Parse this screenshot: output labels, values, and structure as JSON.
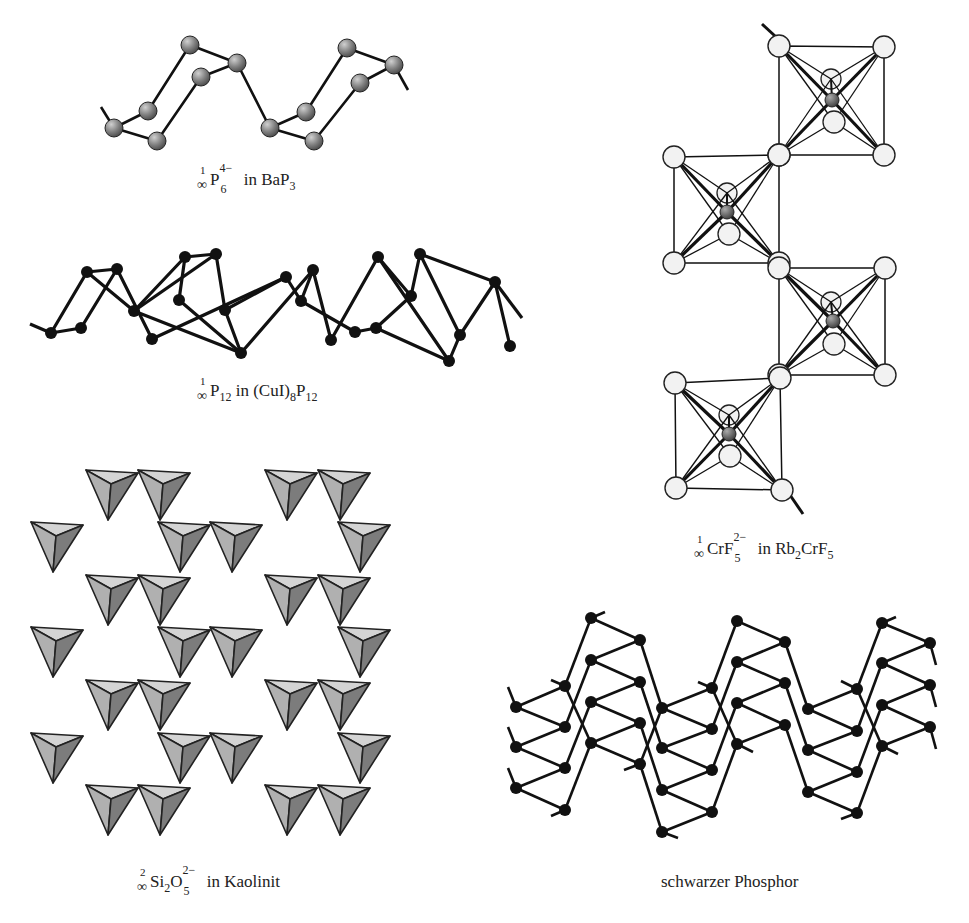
{
  "figure": {
    "panels": [
      {
        "id": "bap3",
        "caption": {
          "dim": "1",
          "inf": "∞",
          "species": "P",
          "sub": "6",
          "sup": "4−",
          "text": " in BaP",
          "tail_sub": "3"
        },
        "caption_pos": [
          197,
          171
        ],
        "atom_style": {
          "fill": "#8a8a8a",
          "r": 9
        },
        "atoms": [
          [
            114,
            128
          ],
          [
            148,
            111
          ],
          [
            157,
            141
          ],
          [
            190,
            45
          ],
          [
            201,
            77
          ],
          [
            237,
            63
          ],
          [
            270,
            128
          ],
          [
            306,
            112
          ],
          [
            314,
            141
          ],
          [
            347,
            48
          ],
          [
            360,
            83
          ],
          [
            394,
            65
          ]
        ],
        "bonds": [
          [
            0,
            1
          ],
          [
            0,
            2
          ],
          [
            1,
            3
          ],
          [
            2,
            4
          ],
          [
            3,
            5
          ],
          [
            4,
            5
          ],
          [
            5,
            6
          ],
          [
            6,
            7
          ],
          [
            6,
            8
          ],
          [
            7,
            9
          ],
          [
            8,
            10
          ],
          [
            9,
            11
          ],
          [
            10,
            11
          ]
        ],
        "tails": [
          [
            [
              114,
              128
            ],
            [
              101,
              107
            ]
          ],
          [
            [
              394,
              65
            ],
            [
              408,
              90
            ]
          ]
        ]
      },
      {
        "id": "cui8p12",
        "caption": {
          "dim": "1",
          "inf": "∞",
          "species": "P",
          "sub": "12",
          "text": " in (CuI)",
          "tail_sub": "8",
          "text2": "P",
          "tail_sub2": "12"
        },
        "caption_pos": [
          197,
          382
        ],
        "atom_style": {
          "fill": "#111111",
          "r": 6
        },
        "atoms": [
          [
            51,
            333
          ],
          [
            81,
            328
          ],
          [
            87,
            272
          ],
          [
            117,
            269
          ],
          [
            134,
            311
          ],
          [
            152,
            339
          ],
          [
            179,
            300
          ],
          [
            185,
            257
          ],
          [
            216,
            254
          ],
          [
            225,
            310
          ],
          [
            241,
            353
          ],
          [
            286,
            277
          ],
          [
            301,
            301
          ],
          [
            313,
            270
          ],
          [
            331,
            340
          ],
          [
            355,
            332
          ],
          [
            376,
            328
          ],
          [
            378,
            257
          ],
          [
            411,
            296
          ],
          [
            420,
            254
          ],
          [
            449,
            361
          ],
          [
            460,
            335
          ],
          [
            495,
            282
          ],
          [
            510,
            346
          ]
        ],
        "bonds": [
          [
            0,
            1
          ],
          [
            0,
            2
          ],
          [
            1,
            3
          ],
          [
            2,
            3
          ],
          [
            2,
            4
          ],
          [
            3,
            5
          ],
          [
            4,
            8
          ],
          [
            4,
            10
          ],
          [
            5,
            11
          ],
          [
            6,
            7
          ],
          [
            6,
            10
          ],
          [
            7,
            8
          ],
          [
            7,
            4
          ],
          [
            8,
            9
          ],
          [
            9,
            11
          ],
          [
            9,
            10
          ],
          [
            10,
            13
          ],
          [
            11,
            12
          ],
          [
            12,
            13
          ],
          [
            12,
            15
          ],
          [
            13,
            14
          ],
          [
            14,
            17
          ],
          [
            15,
            16
          ],
          [
            16,
            18
          ],
          [
            17,
            18
          ],
          [
            17,
            20
          ],
          [
            18,
            19
          ],
          [
            19,
            21
          ],
          [
            19,
            22
          ],
          [
            20,
            21
          ],
          [
            21,
            22
          ],
          [
            22,
            23
          ],
          [
            16,
            20
          ]
        ],
        "tails": [
          [
            [
              51,
              333
            ],
            [
              30,
              324
            ]
          ],
          [
            [
              495,
              282
            ],
            [
              522,
              318
            ]
          ]
        ]
      }
    ],
    "crf5": {
      "caption": {
        "dim": "1",
        "inf": "∞",
        "species": "CrF",
        "sub": "5",
        "sup": "2−",
        "text": " in Rb",
        "tail_sub": "2",
        "text2": "CrF",
        "tail_sub2": "5"
      },
      "caption_pos": [
        694,
        540
      ],
      "octahedra": [
        {
          "corners": [
            [
              779,
              46
            ],
            [
              884,
              47
            ],
            [
              884,
              155
            ],
            [
              779,
              155
            ]
          ],
          "cr": [
            832,
            100
          ],
          "ftop": [
            831,
            79
          ],
          "fbot": [
            834,
            122
          ]
        },
        {
          "corners": [
            [
              674,
              157
            ],
            [
              779,
              155
            ],
            [
              779,
              263
            ],
            [
              674,
              263
            ]
          ],
          "cr": [
            727,
            212
          ],
          "ftop": [
            727,
            193
          ],
          "fbot": [
            729,
            234
          ]
        },
        {
          "corners": [
            [
              779,
              268
            ],
            [
              885,
              268
            ],
            [
              885,
              375
            ],
            [
              779,
              375
            ]
          ],
          "cr": [
            833,
            321
          ],
          "ftop": [
            831,
            302
          ],
          "fbot": [
            834,
            344
          ]
        },
        {
          "corners": [
            [
              675,
              383
            ],
            [
              780,
              378
            ],
            [
              782,
              490
            ],
            [
              676,
              488
            ]
          ],
          "cr": [
            729,
            434
          ],
          "ftop": [
            729,
            415
          ],
          "fbot": [
            730,
            456
          ]
        }
      ],
      "tails": [
        [
          [
            762,
            24
          ],
          [
            775,
            36
          ]
        ],
        [
          [
            790,
            495
          ],
          [
            803,
            514
          ]
        ]
      ],
      "colors": {
        "f": "#f2f2f2",
        "cr": "#666666"
      }
    },
    "kaolinit": {
      "caption": {
        "dim": "2",
        "inf": "∞",
        "species": "Si",
        "sub": "2",
        "text": "O",
        "sup2": "2−",
        "sub2": "5",
        "text2": " in Kaolinit"
      },
      "caption_pos": [
        137,
        873
      ],
      "tet_colors": {
        "light": "#d4d4d4",
        "mid": "#b0b0b0",
        "dark": "#7c7c7c",
        "stroke": "#222222"
      }
    },
    "black_p": {
      "caption": {
        "text": "schwarzer Phosphor"
      },
      "caption_pos": [
        661,
        873
      ],
      "atom_r": 6,
      "columns": [
        {
          "x": 516,
          "ys": [
            707,
            747,
            788
          ]
        },
        {
          "x": 565,
          "ys": [
            686,
            727,
            768,
            810
          ]
        },
        {
          "x": 591,
          "ys": [
            618,
            660,
            702,
            743
          ]
        },
        {
          "x": 640,
          "ys": [
            640,
            682,
            723,
            764
          ]
        },
        {
          "x": 662,
          "ys": [
            708,
            748,
            790,
            832
          ]
        },
        {
          "x": 712,
          "ys": [
            688,
            729,
            770,
            812
          ]
        },
        {
          "x": 737,
          "ys": [
            621,
            662,
            703,
            744
          ]
        },
        {
          "x": 785,
          "ys": [
            642,
            683,
            725
          ]
        },
        {
          "x": 808,
          "ys": [
            709,
            750,
            792
          ]
        },
        {
          "x": 857,
          "ys": [
            689,
            731,
            772,
            813
          ]
        },
        {
          "x": 882,
          "ys": [
            623,
            663,
            705,
            746
          ]
        },
        {
          "x": 930,
          "ys": [
            643,
            685,
            727
          ]
        }
      ]
    }
  }
}
